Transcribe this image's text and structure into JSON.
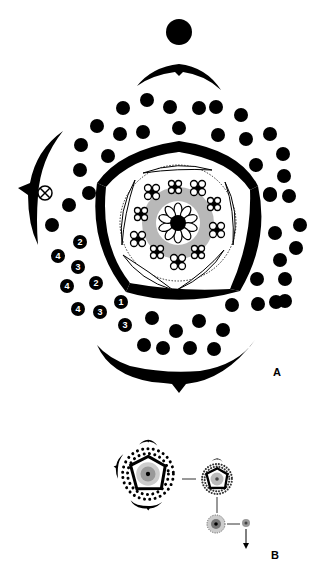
{
  "figure": {
    "type": "floral-diagram",
    "panels": [
      {
        "id": "A",
        "label": "A",
        "description": "Enlarged floral diagram with axis dot, bracts, spirally arranged outer organs, pentagonal whorl of five tepals, inner ring of stamen clusters and central gynoecium",
        "numbered_markers": [
          "2",
          "4",
          "3",
          "4",
          "2",
          "1",
          "4",
          "3",
          "3"
        ],
        "special_marker": "crossed-circle"
      },
      {
        "id": "B",
        "label": "B",
        "description": "Series of progressively smaller floral diagrams connected by lines, ending with an arrow"
      }
    ],
    "colors": {
      "ink": "#000000",
      "gray_fill": "#b8b8b8",
      "background": "#ffffff"
    }
  }
}
